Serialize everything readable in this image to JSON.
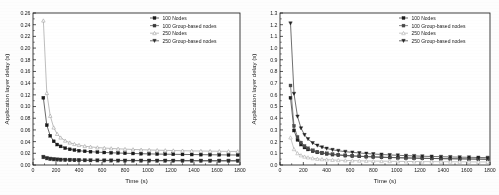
{
  "figure": {
    "background_color": "#fdfdfd",
    "panel_count": 2
  },
  "chart_data": [
    {
      "id": "left-chart",
      "type": "line",
      "title": "",
      "xlabel": "Time (s)",
      "ylabel": "Application layer delay (s)",
      "xlim": [
        0,
        1800
      ],
      "ylim": [
        0.0,
        0.26
      ],
      "xticks": [
        0,
        200,
        400,
        600,
        800,
        1000,
        1200,
        1400,
        1600,
        1800
      ],
      "yticks": [
        0.0,
        0.02,
        0.04,
        0.06,
        0.08,
        0.1,
        0.12,
        0.14,
        0.16,
        0.18,
        0.2,
        0.22,
        0.24,
        0.26
      ],
      "xtick_labels": [
        "0",
        "200",
        "400",
        "600",
        "800",
        "1000",
        "1200",
        "1400",
        "1600",
        "1800"
      ],
      "ytick_labels": [
        "0.00",
        "0.02",
        "0.04",
        "0.06",
        "0.08",
        "0.10",
        "0.12",
        "0.14",
        "0.16",
        "0.18",
        "0.20",
        "0.22",
        "0.24",
        "0.26"
      ],
      "grid": false,
      "legend_position": "upper-right",
      "x": [
        90,
        120,
        150,
        180,
        210,
        240,
        280,
        320,
        360,
        400,
        450,
        500,
        560,
        620,
        680,
        740,
        800,
        870,
        940,
        1010,
        1080,
        1150,
        1220,
        1300,
        1380,
        1460,
        1540,
        1620,
        1700,
        1780
      ],
      "series": [
        {
          "name": "100 Nodes",
          "marker": "square-filled",
          "color": "#1b1b1b",
          "values": [
            0.115,
            0.068,
            0.05,
            0.0405,
            0.035,
            0.0318,
            0.0288,
            0.0268,
            0.0255,
            0.0245,
            0.0234,
            0.0228,
            0.022,
            0.0214,
            0.0209,
            0.0205,
            0.0201,
            0.0197,
            0.0193,
            0.019,
            0.0187,
            0.0185,
            0.0183,
            0.0181,
            0.0179,
            0.0177,
            0.0175,
            0.0174,
            0.0172,
            0.0171
          ]
        },
        {
          "name": "100 Group-based nodes",
          "marker": "square-filled",
          "color": "#3b3b3b",
          "values": [
            0.013,
            0.0112,
            0.01,
            0.0094,
            0.009,
            0.0087,
            0.0084,
            0.0082,
            0.008,
            0.0079,
            0.0078,
            0.0077,
            0.0076,
            0.0075,
            0.0074,
            0.0074,
            0.0073,
            0.0073,
            0.0072,
            0.0072,
            0.0071,
            0.0071,
            0.0071,
            0.007,
            0.007,
            0.007,
            0.0069,
            0.0069,
            0.0069,
            0.0069
          ]
        },
        {
          "name": "250 Nodes",
          "marker": "triangle-up-open",
          "color": "#9a9a9a",
          "values": [
            0.247,
            0.123,
            0.084,
            0.064,
            0.053,
            0.0468,
            0.0415,
            0.0382,
            0.0358,
            0.034,
            0.0322,
            0.031,
            0.0299,
            0.029,
            0.0283,
            0.0277,
            0.0272,
            0.0266,
            0.0261,
            0.0257,
            0.0253,
            0.025,
            0.0247,
            0.0244,
            0.0241,
            0.0239,
            0.0237,
            0.0235,
            0.0233,
            0.0232
          ]
        },
        {
          "name": "250 Group-based nodes",
          "marker": "triangle-down-filled",
          "color": "#2a2a2a",
          "values": [
            0.014,
            0.0121,
            0.0109,
            0.0102,
            0.0097,
            0.0094,
            0.009,
            0.0088,
            0.0086,
            0.0085,
            0.0083,
            0.0082,
            0.0081,
            0.008,
            0.008,
            0.0079,
            0.0079,
            0.0078,
            0.0078,
            0.0077,
            0.0077,
            0.0077,
            0.0076,
            0.0076,
            0.0076,
            0.0075,
            0.0075,
            0.0075,
            0.0075,
            0.0074
          ]
        }
      ]
    },
    {
      "id": "right-chart",
      "type": "line",
      "title": "",
      "xlabel": "Time (s)",
      "ylabel": "Application layer delay (s)",
      "xlim": [
        0,
        1800
      ],
      "ylim": [
        0.0,
        1.3
      ],
      "xticks": [
        0,
        200,
        400,
        600,
        800,
        1000,
        1200,
        1400,
        1600,
        1800
      ],
      "yticks": [
        0.0,
        0.1,
        0.2,
        0.3,
        0.4,
        0.5,
        0.6,
        0.7,
        0.8,
        0.9,
        1.0,
        1.1,
        1.2,
        1.3
      ],
      "xtick_labels": [
        "0",
        "200",
        "400",
        "600",
        "800",
        "1000",
        "1200",
        "1400",
        "1600",
        "1800"
      ],
      "ytick_labels": [
        "0.0",
        "0.1",
        "0.2",
        "0.3",
        "0.4",
        "0.5",
        "0.6",
        "0.7",
        "0.8",
        "0.9",
        "1.0",
        "1.1",
        "1.2",
        "1.3"
      ],
      "grid": false,
      "legend_position": "upper-right",
      "x": [
        90,
        120,
        150,
        180,
        210,
        240,
        280,
        320,
        360,
        400,
        450,
        500,
        560,
        620,
        680,
        740,
        800,
        870,
        940,
        1010,
        1080,
        1150,
        1220,
        1300,
        1380,
        1460,
        1540,
        1620,
        1700,
        1780
      ],
      "series": [
        {
          "name": "100 Nodes",
          "marker": "square-filled",
          "color": "#1b1b1b",
          "values": [
            0.575,
            0.295,
            0.215,
            0.175,
            0.15,
            0.133,
            0.118,
            0.108,
            0.101,
            0.095,
            0.089,
            0.085,
            0.08,
            0.077,
            0.074,
            0.071,
            0.069,
            0.066,
            0.064,
            0.062,
            0.06,
            0.059,
            0.057,
            0.056,
            0.054,
            0.053,
            0.052,
            0.051,
            0.05,
            0.049
          ]
        },
        {
          "name": "100 Group-based nodes",
          "marker": "square-filled",
          "color": "#4a4a4a",
          "values": [
            0.68,
            0.335,
            0.24,
            0.192,
            0.163,
            0.143,
            0.126,
            0.114,
            0.106,
            0.1,
            0.093,
            0.088,
            0.083,
            0.079,
            0.076,
            0.073,
            0.07,
            0.067,
            0.065,
            0.063,
            0.061,
            0.059,
            0.058,
            0.056,
            0.055,
            0.054,
            0.053,
            0.052,
            0.051,
            0.05
          ]
        },
        {
          "name": "250 Nodes",
          "marker": "triangle-up-open",
          "color": "#a8a8a8",
          "values": [
            0.235,
            0.135,
            0.1,
            0.082,
            0.071,
            0.064,
            0.057,
            0.052,
            0.049,
            0.046,
            0.043,
            0.041,
            0.039,
            0.038,
            0.036,
            0.035,
            0.034,
            0.033,
            0.032,
            0.031,
            0.03,
            0.03,
            0.029,
            0.029,
            0.028,
            0.028,
            0.027,
            0.027,
            0.026,
            0.026
          ]
        },
        {
          "name": "250 Group-based nodes",
          "marker": "triangle-down-filled",
          "color": "#222222",
          "values": [
            1.212,
            0.61,
            0.415,
            0.315,
            0.258,
            0.222,
            0.188,
            0.167,
            0.152,
            0.141,
            0.13,
            0.122,
            0.114,
            0.108,
            0.103,
            0.098,
            0.094,
            0.09,
            0.086,
            0.083,
            0.08,
            0.078,
            0.075,
            0.073,
            0.071,
            0.069,
            0.067,
            0.066,
            0.064,
            0.063
          ]
        }
      ]
    }
  ]
}
